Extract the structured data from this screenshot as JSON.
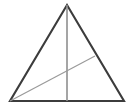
{
  "figure": {
    "kind": "geometry-diagram",
    "canvas": {
      "width": 132,
      "height": 112,
      "background": "#ffffff"
    },
    "labels": [],
    "points": {
      "apex": {
        "name": "A",
        "x": 67,
        "y": 5
      },
      "bottom_left": {
        "name": "B",
        "x": 10,
        "y": 101
      },
      "bottom_right": {
        "name": "C",
        "x": 124,
        "y": 101
      },
      "base_midpoint": {
        "name": "M",
        "x": 67,
        "y": 101
      },
      "cevian_foot": {
        "name": "D",
        "x": 95,
        "y": 56
      },
      "intersection": {
        "name": "P",
        "x": 67,
        "y": 73
      }
    },
    "shapes": {
      "triangle": {
        "label": "triangle-outline",
        "points": "67,5 124,101 10,101",
        "stroke": "#3c3c3c",
        "stroke_width": 2.1,
        "fill": "none"
      },
      "median": {
        "label": "vertical-median",
        "x1": 67,
        "y1": 5,
        "x2": 67,
        "y2": 101,
        "stroke": "#8f8f8f",
        "stroke_width": 1.6
      },
      "cevian": {
        "label": "diagonal-cevian",
        "x1": 10,
        "y1": 101,
        "x2": 95,
        "y2": 56,
        "stroke": "#9a9a9a",
        "stroke_width": 1.2
      }
    }
  }
}
